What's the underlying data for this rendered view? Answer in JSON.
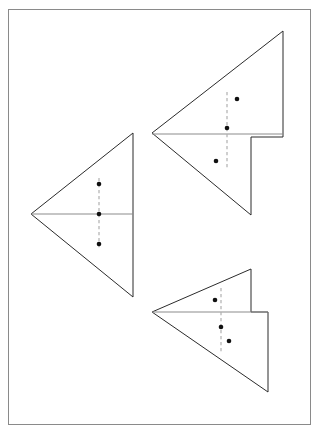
{
  "page": {
    "width": 319,
    "height": 434,
    "background_color": "#ffffff",
    "border": {
      "x": 8,
      "y": 9,
      "width": 303,
      "height": 416,
      "color": "#8a8a8a",
      "stroke_width": 1
    }
  },
  "style": {
    "outline_color": "#2b2b2b",
    "fold_line_color": "#8c8c8c",
    "dashed_crease_color": "#b0b0b0",
    "dot_color": "#111111",
    "dot_radius": 2.3
  },
  "figures": [
    {
      "id": "figure-left-unfolded",
      "name": "unfolded-triangle-with-three-holes",
      "label": "Left triangle",
      "outline_points": "133,133 31,214 133,297",
      "fold_lines": [
        {
          "name": "horizontal-fold",
          "x1": 31,
          "y1": 214,
          "x2": 133,
          "y2": 214
        }
      ],
      "dashed_creases": [
        {
          "name": "vertical-crease",
          "x1": 99,
          "y1": 178,
          "x2": 99,
          "y2": 250
        }
      ],
      "dots": [
        {
          "name": "hole-top",
          "cx": 99,
          "cy": 184
        },
        {
          "name": "hole-middle",
          "cx": 99,
          "cy": 214
        },
        {
          "name": "hole-bottom",
          "cx": 99,
          "cy": 244
        }
      ]
    },
    {
      "id": "figure-top-right-folded",
      "name": "folded-triangle-with-notch-upper",
      "label": "Top right folded triangle",
      "outline_points": "283,31 152,133 251,215 251,137 283,137 283,31",
      "fold_lines": [
        {
          "name": "horizontal-fold",
          "x1": 152,
          "y1": 134,
          "x2": 283,
          "y2": 134
        }
      ],
      "dashed_creases": [
        {
          "name": "vertical-crease",
          "x1": 227,
          "y1": 92,
          "x2": 227,
          "y2": 170
        }
      ],
      "dots": [
        {
          "name": "hole-upper-right",
          "cx": 237,
          "cy": 99
        },
        {
          "name": "hole-on-crease",
          "cx": 227,
          "cy": 128
        },
        {
          "name": "hole-lower-left",
          "cx": 216,
          "cy": 161
        }
      ]
    },
    {
      "id": "figure-bottom-right-folded",
      "name": "folded-triangle-with-notch-lower",
      "label": "Bottom right folded triangle",
      "outline_points": "251,269 152,312 268,392 268,312 251,312 251,269",
      "fold_lines": [
        {
          "name": "horizontal-fold",
          "x1": 152,
          "y1": 312,
          "x2": 268,
          "y2": 312
        }
      ],
      "dashed_creases": [
        {
          "name": "vertical-crease",
          "x1": 221,
          "y1": 288,
          "x2": 221,
          "y2": 352
        }
      ],
      "dots": [
        {
          "name": "hole-upper-left",
          "cx": 215,
          "cy": 300
        },
        {
          "name": "hole-on-crease",
          "cx": 221,
          "cy": 327
        },
        {
          "name": "hole-lower-right",
          "cx": 229,
          "cy": 341
        }
      ]
    }
  ]
}
